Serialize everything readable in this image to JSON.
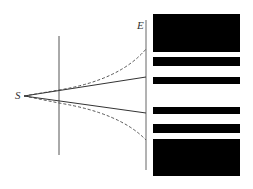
{
  "diagram": {
    "labels": {
      "source": "S",
      "screen": "E"
    },
    "colors": {
      "background": "#ffffff",
      "line": "#555555",
      "fringe": "#000000"
    },
    "components": [
      {
        "name": "point-source",
        "label": "S"
      },
      {
        "name": "slit-barrier"
      },
      {
        "name": "screen",
        "label": "E"
      },
      {
        "name": "geometric-rays",
        "style": "solid"
      },
      {
        "name": "diffracted-envelope",
        "style": "dashed"
      },
      {
        "name": "fringe-pattern",
        "dark_bands": 6
      }
    ]
  }
}
